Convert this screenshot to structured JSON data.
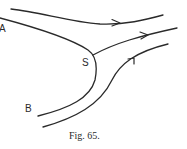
{
  "figure": {
    "caption": "Fig. 65.",
    "labels": {
      "a": "A",
      "s": "S",
      "b": "B"
    },
    "stroke_color": "#2a2a2a",
    "background": "#ffffff"
  }
}
